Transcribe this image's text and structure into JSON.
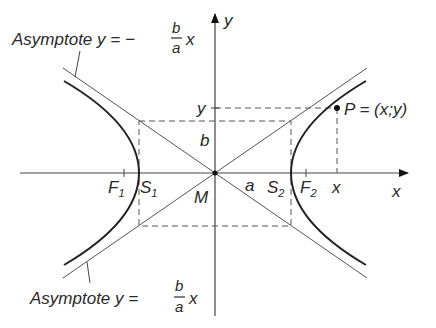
{
  "diagram": {
    "type": "hyperbola",
    "axes": {
      "x_label": "x",
      "y_label": "y"
    },
    "center_label": "M",
    "vertices": {
      "left": "S",
      "left_sub": "1",
      "right": "S",
      "right_sub": "2"
    },
    "foci": {
      "left": "F",
      "left_sub": "1",
      "right": "F",
      "right_sub": "2"
    },
    "semi_axes": {
      "a": "a",
      "b": "b"
    },
    "point": {
      "label": "P = (x;y)",
      "x_tick": "x",
      "y_tick": "y"
    },
    "asymptote_top": {
      "prefix": "Asymptote y = −",
      "num": "b",
      "den": "a",
      "suffix": "x"
    },
    "asymptote_bottom": {
      "prefix": "Asymptote y = ",
      "num": "b",
      "den": "a",
      "suffix": "x"
    }
  },
  "colors": {
    "curve": "#222222",
    "lines": "#555555",
    "text": "#2a2a2a"
  }
}
